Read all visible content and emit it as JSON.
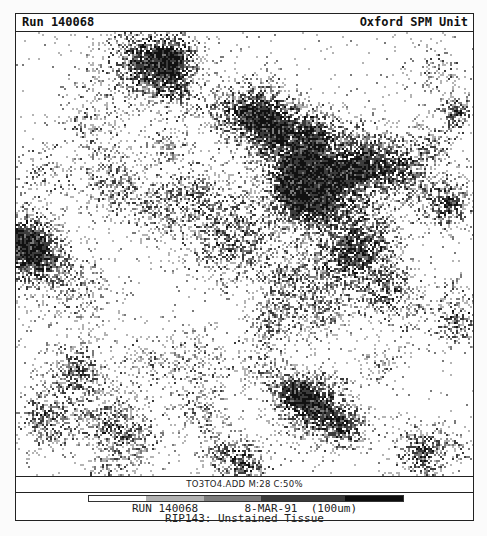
{
  "header": {
    "run_label": "Run 140068",
    "unit_label": "Oxford SPM Unit"
  },
  "image": {
    "description": "Proton microprobe elemental density map (stippled grayscale)",
    "width_px": 457,
    "height_px": 444,
    "palette": [
      "#ffffff",
      "#b4b4b4",
      "#7a7a7a",
      "#3c3c3c",
      "#111111"
    ],
    "background_noise": 0.025,
    "blobs": [
      {
        "x": 130,
        "y": 30,
        "r": 38,
        "i": 0.85
      },
      {
        "x": 158,
        "y": 28,
        "r": 26,
        "i": 0.7
      },
      {
        "x": 75,
        "y": 90,
        "r": 28,
        "i": 0.35
      },
      {
        "x": 160,
        "y": 60,
        "r": 18,
        "i": 0.45
      },
      {
        "x": 205,
        "y": 80,
        "r": 24,
        "i": 0.45
      },
      {
        "x": 95,
        "y": 150,
        "r": 30,
        "i": 0.55
      },
      {
        "x": 140,
        "y": 175,
        "r": 28,
        "i": 0.45
      },
      {
        "x": 180,
        "y": 160,
        "r": 26,
        "i": 0.55
      },
      {
        "x": 25,
        "y": 140,
        "r": 22,
        "i": 0.35
      },
      {
        "x": 8,
        "y": 210,
        "r": 32,
        "i": 1.0
      },
      {
        "x": 25,
        "y": 230,
        "r": 30,
        "i": 0.5
      },
      {
        "x": 60,
        "y": 260,
        "r": 30,
        "i": 0.35
      },
      {
        "x": 215,
        "y": 205,
        "r": 40,
        "i": 0.7
      },
      {
        "x": 240,
        "y": 80,
        "r": 30,
        "i": 0.75
      },
      {
        "x": 260,
        "y": 100,
        "r": 34,
        "i": 0.8
      },
      {
        "x": 300,
        "y": 100,
        "r": 22,
        "i": 0.7
      },
      {
        "x": 300,
        "y": 160,
        "r": 42,
        "i": 1.0
      },
      {
        "x": 285,
        "y": 150,
        "r": 28,
        "i": 1.0
      },
      {
        "x": 345,
        "y": 130,
        "r": 32,
        "i": 0.85
      },
      {
        "x": 385,
        "y": 140,
        "r": 30,
        "i": 0.7
      },
      {
        "x": 430,
        "y": 170,
        "r": 24,
        "i": 0.85
      },
      {
        "x": 440,
        "y": 80,
        "r": 15,
        "i": 0.9
      },
      {
        "x": 415,
        "y": 110,
        "r": 22,
        "i": 0.4
      },
      {
        "x": 350,
        "y": 210,
        "r": 32,
        "i": 0.7
      },
      {
        "x": 370,
        "y": 260,
        "r": 30,
        "i": 0.65
      },
      {
        "x": 320,
        "y": 230,
        "r": 30,
        "i": 0.6
      },
      {
        "x": 270,
        "y": 250,
        "r": 28,
        "i": 0.55
      },
      {
        "x": 255,
        "y": 290,
        "r": 24,
        "i": 0.55
      },
      {
        "x": 305,
        "y": 280,
        "r": 24,
        "i": 0.45
      },
      {
        "x": 440,
        "y": 285,
        "r": 26,
        "i": 0.65
      },
      {
        "x": 420,
        "y": 40,
        "r": 24,
        "i": 0.35
      },
      {
        "x": 240,
        "y": 335,
        "r": 22,
        "i": 0.35
      },
      {
        "x": 180,
        "y": 330,
        "r": 30,
        "i": 0.35
      },
      {
        "x": 60,
        "y": 340,
        "r": 26,
        "i": 0.75
      },
      {
        "x": 30,
        "y": 385,
        "r": 26,
        "i": 0.7
      },
      {
        "x": 90,
        "y": 390,
        "r": 28,
        "i": 0.6
      },
      {
        "x": 120,
        "y": 405,
        "r": 26,
        "i": 0.45
      },
      {
        "x": 185,
        "y": 380,
        "r": 22,
        "i": 0.4
      },
      {
        "x": 200,
        "y": 420,
        "r": 20,
        "i": 0.35
      },
      {
        "x": 300,
        "y": 375,
        "r": 30,
        "i": 1.0
      },
      {
        "x": 275,
        "y": 360,
        "r": 22,
        "i": 0.7
      },
      {
        "x": 330,
        "y": 395,
        "r": 20,
        "i": 0.75
      },
      {
        "x": 225,
        "y": 430,
        "r": 22,
        "i": 0.8
      },
      {
        "x": 405,
        "y": 420,
        "r": 24,
        "i": 0.85
      },
      {
        "x": 440,
        "y": 410,
        "r": 14,
        "i": 0.4
      },
      {
        "x": 95,
        "y": 440,
        "r": 22,
        "i": 0.35
      },
      {
        "x": 150,
        "y": 115,
        "r": 18,
        "i": 0.35
      },
      {
        "x": 130,
        "y": 330,
        "r": 24,
        "i": 0.3
      },
      {
        "x": 365,
        "y": 330,
        "r": 18,
        "i": 0.35
      }
    ]
  },
  "label_row": {
    "text": "TO3TO4.ADD M:28 C:50%"
  },
  "footer": {
    "scale_bar": [
      {
        "color": "#ffffff",
        "width": 57
      },
      {
        "color": "#b2b2b2",
        "width": 58
      },
      {
        "color": "#7c7c7c",
        "width": 57
      },
      {
        "color": "#3a3a3a",
        "width": 84
      },
      {
        "color": "#0e0e0e",
        "width": 58
      }
    ],
    "line1": "RUN 140068       8-MAR-91  (100um)",
    "line2": "RIP143: Unstained Tissue"
  }
}
